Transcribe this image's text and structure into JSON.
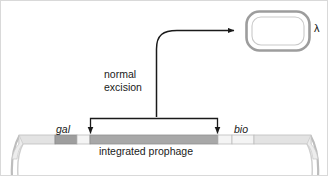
{
  "figure": {
    "background_color": "#ffffff",
    "border_color": "#d9d9d9",
    "width": 328,
    "height": 176
  },
  "labels": {
    "normal_excision": "normal\nexcision",
    "gal": "gal",
    "bio": "bio",
    "integrated_prophage": "integrated prophage",
    "lambda": "λ"
  },
  "colors": {
    "stroke_dark": "#1a1a1a",
    "chromosome_outline": "#b0b0b0",
    "chromosome_fill_light": "#e3e3e3",
    "gene_block_fill": "#9e9e9e",
    "prophage_fill": "#a8a8a8",
    "spacer_fill": "#f2f2f2",
    "phage_ring_outline": "#9a9a9a",
    "phage_ring_fill": "#e6e6e6",
    "text": "#1a1a1a"
  },
  "diagram": {
    "type": "biology-schematic",
    "chromosome": {
      "name": "bacterial-chromosome",
      "bar_y": 134,
      "bar_height": 9,
      "left_end_x": 18,
      "right_end_x": 310,
      "segments": [
        {
          "name": "chromosome-left-arm",
          "x": 18,
          "width": 36,
          "fill": "#e3e3e3"
        },
        {
          "name": "gal-gene-block",
          "x": 54,
          "width": 22,
          "fill": "#9e9e9e"
        },
        {
          "name": "left-spacer",
          "x": 76,
          "width": 13,
          "fill": "#f2f2f2"
        },
        {
          "name": "integrated-prophage-block",
          "x": 89,
          "width": 128,
          "fill": "#a8a8a8"
        },
        {
          "name": "right-spacer",
          "x": 217,
          "width": 14,
          "fill": "#f2f2f2"
        },
        {
          "name": "bio-gene-block",
          "x": 231,
          "width": 22,
          "fill": "#f2f2f2"
        },
        {
          "name": "chromosome-right-arm",
          "x": 253,
          "width": 57,
          "fill": "#e3e3e3"
        }
      ]
    },
    "excision_bracket": {
      "name": "excision-bracket",
      "left_arrow_x": 89,
      "right_arrow_x": 217,
      "top_y": 117,
      "arrow_tip_y": 133
    },
    "excision_arrow": {
      "name": "excision-curved-arrow",
      "start_x": 155,
      "start_y": 117,
      "corner_y": 30,
      "end_x": 238,
      "end_y": 30
    },
    "phage_particle": {
      "name": "excised-lambda-circle",
      "cx": 277,
      "cy": 30,
      "rx": 32,
      "ry": 20
    }
  }
}
